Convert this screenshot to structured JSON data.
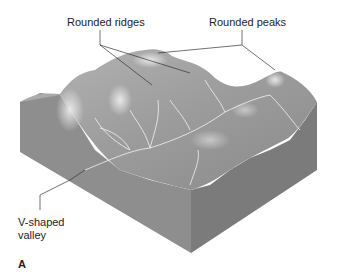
{
  "figure": {
    "labels": {
      "rounded_ridges": "Rounded ridges",
      "rounded_peaks": "Rounded peaks",
      "v_valley_line1": "V-shaped",
      "v_valley_line2": "valley"
    },
    "panel_letter": "A",
    "colors": {
      "left_face": "#8f8f8f",
      "right_face": "#7a7a7a",
      "surface": "#a8a8a8",
      "highlight": "#e6e6e6",
      "streams": "#f2f2f2",
      "leader": "#333333"
    }
  }
}
